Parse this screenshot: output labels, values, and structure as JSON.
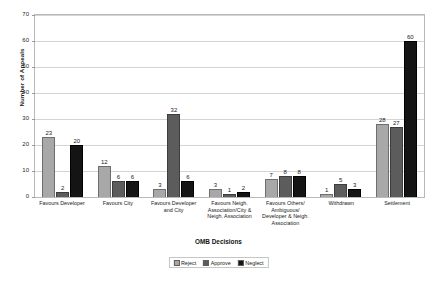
{
  "chart_data": {
    "type": "bar",
    "title": "",
    "xlabel": "OMB Decisions",
    "ylabel": "Number of Appeals",
    "ylim": [
      0,
      70
    ],
    "yticks": [
      0,
      10,
      20,
      30,
      40,
      50,
      60,
      70
    ],
    "grid": true,
    "legend_position": "bottom",
    "categories": [
      "Favours Developer",
      "Favours City",
      "Favours Developer and City",
      "Favours Neigh. Association/City & Neigh. Association",
      "Favours Others/ Ambiguous/ Developer & Neigh. Association",
      "Withdrawn",
      "Settlement"
    ],
    "series": [
      {
        "name": "Reject",
        "color": "#a8a8a8",
        "values": [
          23,
          12,
          3,
          3,
          7,
          1,
          28
        ]
      },
      {
        "name": "Approve",
        "color": "#5c5c5c",
        "values": [
          2,
          6,
          32,
          1,
          8,
          5,
          27
        ]
      },
      {
        "name": "Neglect",
        "color": "#141414",
        "values": [
          20,
          6,
          6,
          2,
          8,
          3,
          60
        ]
      }
    ]
  },
  "legend": {
    "items": [
      {
        "label": "Reject"
      },
      {
        "label": "Approve"
      },
      {
        "label": "Neglect"
      }
    ]
  }
}
